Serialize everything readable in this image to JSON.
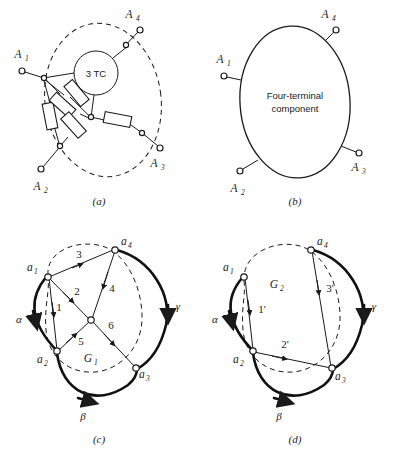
{
  "figure": {
    "panels": [
      {
        "id": "a",
        "caption": "(a)",
        "name": "internal-network-panel",
        "component_label": "3 TC",
        "terminals": [
          {
            "label": "A",
            "sub": "1"
          },
          {
            "label": "A",
            "sub": "2"
          },
          {
            "label": "A",
            "sub": "3"
          },
          {
            "label": "A",
            "sub": "4"
          }
        ],
        "element_count": 6,
        "element_type": "resistor"
      },
      {
        "id": "b",
        "caption": "(b)",
        "name": "black-box-panel",
        "component_text_line1": "Four-terminal",
        "component_text_line2": "component",
        "terminals": [
          {
            "label": "A",
            "sub": "1"
          },
          {
            "label": "A",
            "sub": "2"
          },
          {
            "label": "A",
            "sub": "3"
          },
          {
            "label": "A",
            "sub": "4"
          }
        ]
      },
      {
        "id": "c",
        "caption": "(c)",
        "name": "graph-g1-panel",
        "graph_label": "G",
        "graph_sub": "1",
        "vertices": [
          {
            "label": "a",
            "sub": "1"
          },
          {
            "label": "a",
            "sub": "2"
          },
          {
            "label": "a",
            "sub": "3"
          },
          {
            "label": "a",
            "sub": "4"
          }
        ],
        "edges": [
          "1",
          "2",
          "3",
          "4",
          "5",
          "6"
        ],
        "boundary_edges": [
          "α",
          "β",
          "γ"
        ]
      },
      {
        "id": "d",
        "caption": "(d)",
        "name": "graph-g2-panel",
        "graph_label": "G",
        "graph_sub": "2",
        "vertices": [
          {
            "label": "a",
            "sub": "1"
          },
          {
            "label": "a",
            "sub": "2"
          },
          {
            "label": "a",
            "sub": "3"
          },
          {
            "label": "a",
            "sub": "4"
          }
        ],
        "edges": [
          "1'",
          "2'",
          "3'"
        ],
        "boundary_edges": [
          "α",
          "β",
          "γ"
        ]
      }
    ],
    "colors": {
      "ink": "#1a1a1a",
      "background": "#ffffff"
    }
  }
}
